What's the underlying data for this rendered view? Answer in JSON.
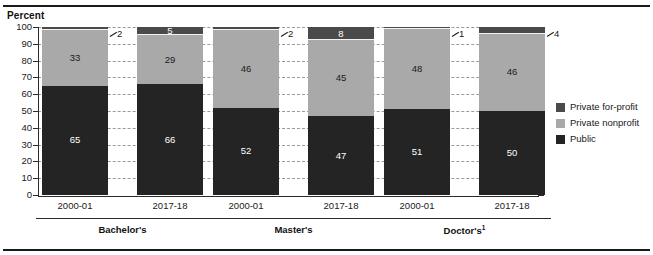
{
  "chart_data": {
    "type": "bar",
    "subtype": "100% stacked bar",
    "title": "",
    "xlabel": "",
    "ylabel": "Percent",
    "ylim": [
      0,
      100
    ],
    "yticks": [
      0,
      10,
      20,
      30,
      40,
      50,
      60,
      70,
      80,
      90,
      100
    ],
    "grid": true,
    "legend_position": "right",
    "categories": [
      "2000-01",
      "2017-18",
      "2000-01",
      "2017-18",
      "2000-01",
      "2017-18"
    ],
    "groups": [
      {
        "label": "Bachelor's",
        "footnote": "",
        "categories": [
          "2000-01",
          "2017-18"
        ]
      },
      {
        "label": "Master's",
        "footnote": "",
        "categories": [
          "2000-01",
          "2017-18"
        ]
      },
      {
        "label": "Doctor's",
        "footnote": "1",
        "categories": [
          "2000-01",
          "2017-18"
        ]
      }
    ],
    "series": [
      {
        "name": "Public",
        "color": "#242424",
        "values": [
          65,
          66,
          52,
          47,
          51,
          50
        ]
      },
      {
        "name": "Private nonprofit",
        "color": "#a9a9a9",
        "values": [
          33,
          29,
          46,
          45,
          48,
          46
        ]
      },
      {
        "name": "Private for-profit",
        "color": "#4a4a4a",
        "values": [
          2,
          5,
          2,
          8,
          1,
          4
        ]
      }
    ],
    "bars": [
      {
        "group": "Bachelor's",
        "category": "2000-01",
        "segments": [
          {
            "series": "Public",
            "value": 65,
            "label": "65",
            "label_placement": "inside",
            "label_color": "light"
          },
          {
            "series": "Private nonprofit",
            "value": 33,
            "label": "33",
            "label_placement": "inside",
            "label_color": "dark"
          },
          {
            "series": "Private for-profit",
            "value": 2,
            "label": "2",
            "label_placement": "callout",
            "label_color": "dark"
          }
        ]
      },
      {
        "group": "Bachelor's",
        "category": "2017-18",
        "segments": [
          {
            "series": "Public",
            "value": 66,
            "label": "66",
            "label_placement": "inside",
            "label_color": "light"
          },
          {
            "series": "Private nonprofit",
            "value": 29,
            "label": "29",
            "label_placement": "inside",
            "label_color": "dark"
          },
          {
            "series": "Private for-profit",
            "value": 5,
            "label": "5",
            "label_placement": "inside",
            "label_color": "light"
          }
        ]
      },
      {
        "group": "Master's",
        "category": "2000-01",
        "segments": [
          {
            "series": "Public",
            "value": 52,
            "label": "52",
            "label_placement": "inside",
            "label_color": "light"
          },
          {
            "series": "Private nonprofit",
            "value": 46,
            "label": "46",
            "label_placement": "inside",
            "label_color": "dark"
          },
          {
            "series": "Private for-profit",
            "value": 2,
            "label": "2",
            "label_placement": "callout",
            "label_color": "dark"
          }
        ]
      },
      {
        "group": "Master's",
        "category": "2017-18",
        "segments": [
          {
            "series": "Public",
            "value": 47,
            "label": "47",
            "label_placement": "inside",
            "label_color": "light"
          },
          {
            "series": "Private nonprofit",
            "value": 45,
            "label": "45",
            "label_placement": "inside",
            "label_color": "dark"
          },
          {
            "series": "Private for-profit",
            "value": 8,
            "label": "8",
            "label_placement": "inside",
            "label_color": "light"
          }
        ]
      },
      {
        "group": "Doctor's",
        "category": "2000-01",
        "segments": [
          {
            "series": "Public",
            "value": 51,
            "label": "51",
            "label_placement": "inside",
            "label_color": "light"
          },
          {
            "series": "Private nonprofit",
            "value": 48,
            "label": "48",
            "label_placement": "inside",
            "label_color": "dark"
          },
          {
            "series": "Private for-profit",
            "value": 1,
            "label": "1",
            "label_placement": "callout",
            "label_color": "dark"
          }
        ]
      },
      {
        "group": "Doctor's",
        "category": "2017-18",
        "segments": [
          {
            "series": "Public",
            "value": 50,
            "label": "50",
            "label_placement": "inside",
            "label_color": "light"
          },
          {
            "series": "Private nonprofit",
            "value": 46,
            "label": "46",
            "label_placement": "inside",
            "label_color": "dark"
          },
          {
            "series": "Private for-profit",
            "value": 4,
            "label": "4",
            "label_placement": "callout",
            "label_color": "dark"
          }
        ]
      }
    ]
  },
  "axis": {
    "title": "Percent",
    "ticks": [
      "100",
      "90",
      "80",
      "70",
      "60",
      "50",
      "40",
      "30",
      "20",
      "10",
      "0"
    ]
  },
  "xlabels": [
    "2000-01",
    "2017-18",
    "2000-01",
    "2017-18",
    "2000-01",
    "2017-18"
  ],
  "groups": [
    {
      "label": "Bachelor's",
      "footnote": ""
    },
    {
      "label": "Master's",
      "footnote": ""
    },
    {
      "label": "Doctor's",
      "footnote": "1"
    }
  ],
  "callouts": [
    {
      "label": "2"
    },
    {
      "label": "2"
    },
    {
      "label": "1"
    },
    {
      "label": "4"
    }
  ],
  "legend": {
    "items": [
      {
        "label": "Private for-profit",
        "color": "#4a4a4a"
      },
      {
        "label": "Private nonprofit",
        "color": "#a9a9a9"
      },
      {
        "label": "Public",
        "color": "#242424"
      }
    ]
  },
  "colors": {
    "public": "#242424",
    "private_nonprofit": "#a9a9a9",
    "private_for_profit": "#4a4a4a",
    "axis": "#2b2b2b",
    "grid": "#9a9a9a",
    "background": "#ffffff"
  }
}
